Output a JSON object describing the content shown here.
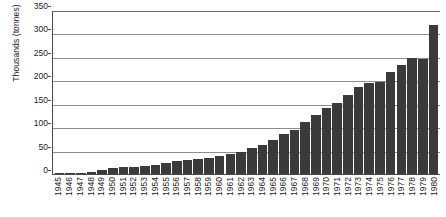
{
  "chart_data": {
    "type": "bar",
    "title": "",
    "subtitle": "",
    "xlabel": "",
    "ylabel": "Thousands (tonnes)",
    "ylim": [
      0,
      350
    ],
    "yticks": [
      0,
      50,
      100,
      150,
      200,
      250,
      300,
      350
    ],
    "grid": "horizontal",
    "legend": "none",
    "bar_color": "#3a3a3a",
    "categories": [
      "1945",
      "1946",
      "1947",
      "1948",
      "1949",
      "1950",
      "1951",
      "1952",
      "1953",
      "1954",
      "1955",
      "1956",
      "1957",
      "1958",
      "1959",
      "1960",
      "1961",
      "1962",
      "1963",
      "1964",
      "1965",
      "1966",
      "1967",
      "1968",
      "1969",
      "1970",
      "1971",
      "1972",
      "1973",
      "1974",
      "1975",
      "1976",
      "1977",
      "1978",
      "1979",
      "1980"
    ],
    "values": [
      1,
      2,
      3,
      5,
      8,
      12,
      14,
      16,
      18,
      20,
      24,
      27,
      29,
      32,
      35,
      38,
      42,
      48,
      55,
      62,
      72,
      85,
      95,
      110,
      125,
      140,
      152,
      168,
      185,
      195,
      196,
      218,
      232,
      248,
      245,
      318
    ],
    "value_unit": "thousand tonnes"
  }
}
